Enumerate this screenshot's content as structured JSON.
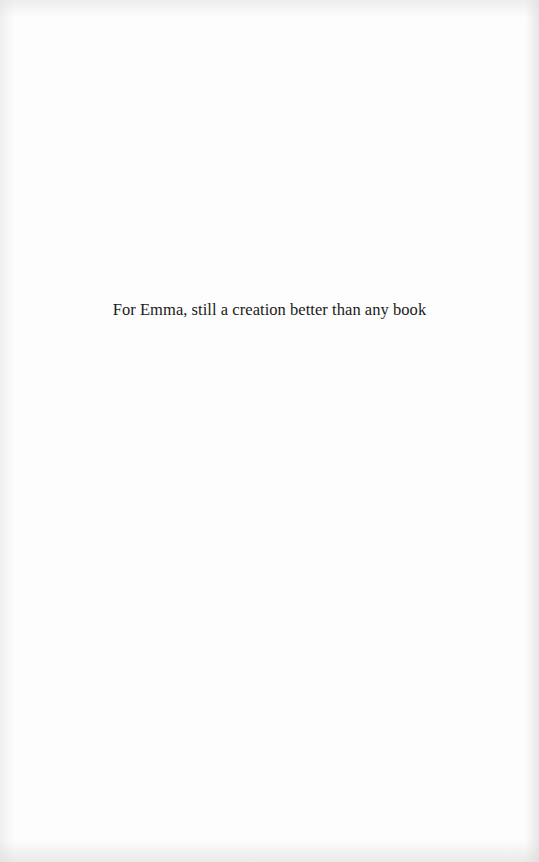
{
  "page": {
    "type": "book-dedication-page",
    "background_color": "#fdfdfd",
    "text_color": "#1a1a1a"
  },
  "dedication": {
    "text": "For Emma, still a creation better than any book"
  }
}
